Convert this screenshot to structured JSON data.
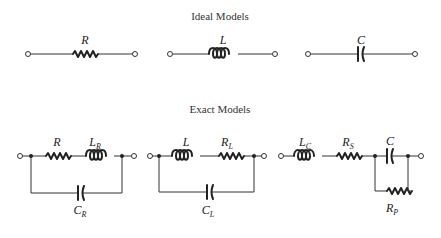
{
  "titles": {
    "ideal": "Ideal Models",
    "exact": "Exact Models"
  },
  "ideal_models": [
    {
      "component": "resistor",
      "label": "R",
      "sub": ""
    },
    {
      "component": "inductor",
      "label": "L",
      "sub": ""
    },
    {
      "component": "capacitor",
      "label": "C",
      "sub": ""
    }
  ],
  "exact_models": {
    "resistor": {
      "series": [
        {
          "component": "resistor",
          "label": "R",
          "sub": ""
        },
        {
          "component": "inductor",
          "label": "L",
          "sub": "R"
        }
      ],
      "parallel": {
        "component": "capacitor",
        "label": "C",
        "sub": "R"
      }
    },
    "inductor": {
      "series": [
        {
          "component": "inductor",
          "label": "L",
          "sub": ""
        },
        {
          "component": "resistor",
          "label": "R",
          "sub": "L"
        }
      ],
      "parallel": {
        "component": "capacitor",
        "label": "C",
        "sub": "L"
      }
    },
    "capacitor": {
      "series": [
        {
          "component": "inductor",
          "label": "L",
          "sub": "C"
        },
        {
          "component": "resistor",
          "label": "R",
          "sub": "S"
        }
      ],
      "parallel_pair": [
        {
          "component": "capacitor",
          "label": "C",
          "sub": ""
        },
        {
          "component": "resistor",
          "label": "R",
          "sub": "P"
        }
      ]
    }
  }
}
